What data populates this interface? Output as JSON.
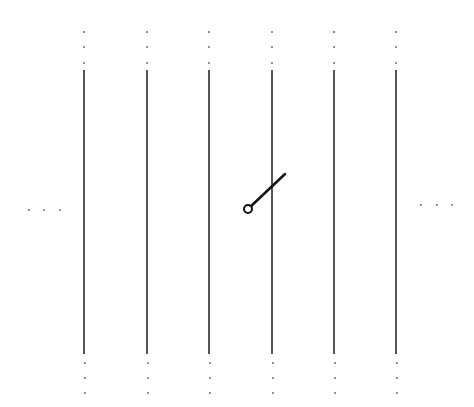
{
  "diagram": {
    "type": "switch-schematic",
    "colors": {
      "line": "#555555",
      "lever": "#111111",
      "dot": "#777777",
      "background": "#ffffff"
    },
    "conductors": [
      {
        "x": 84
      },
      {
        "x": 147
      },
      {
        "x": 209
      },
      {
        "x": 272
      },
      {
        "x": 334
      },
      {
        "x": 396
      }
    ],
    "conductor_y": [
      70,
      354
    ],
    "top_dots_y": [
      32,
      47,
      63
    ],
    "bottom_dots_y": [
      363,
      378,
      393
    ],
    "left_ellipsis": {
      "y": 210,
      "x": [
        29,
        44,
        60
      ]
    },
    "right_ellipsis": {
      "y": 205,
      "x": [
        421,
        437,
        452
      ]
    },
    "switch": {
      "pivot": [
        248,
        209
      ],
      "pivot_radius": 4,
      "end": [
        285,
        174
      ]
    }
  }
}
